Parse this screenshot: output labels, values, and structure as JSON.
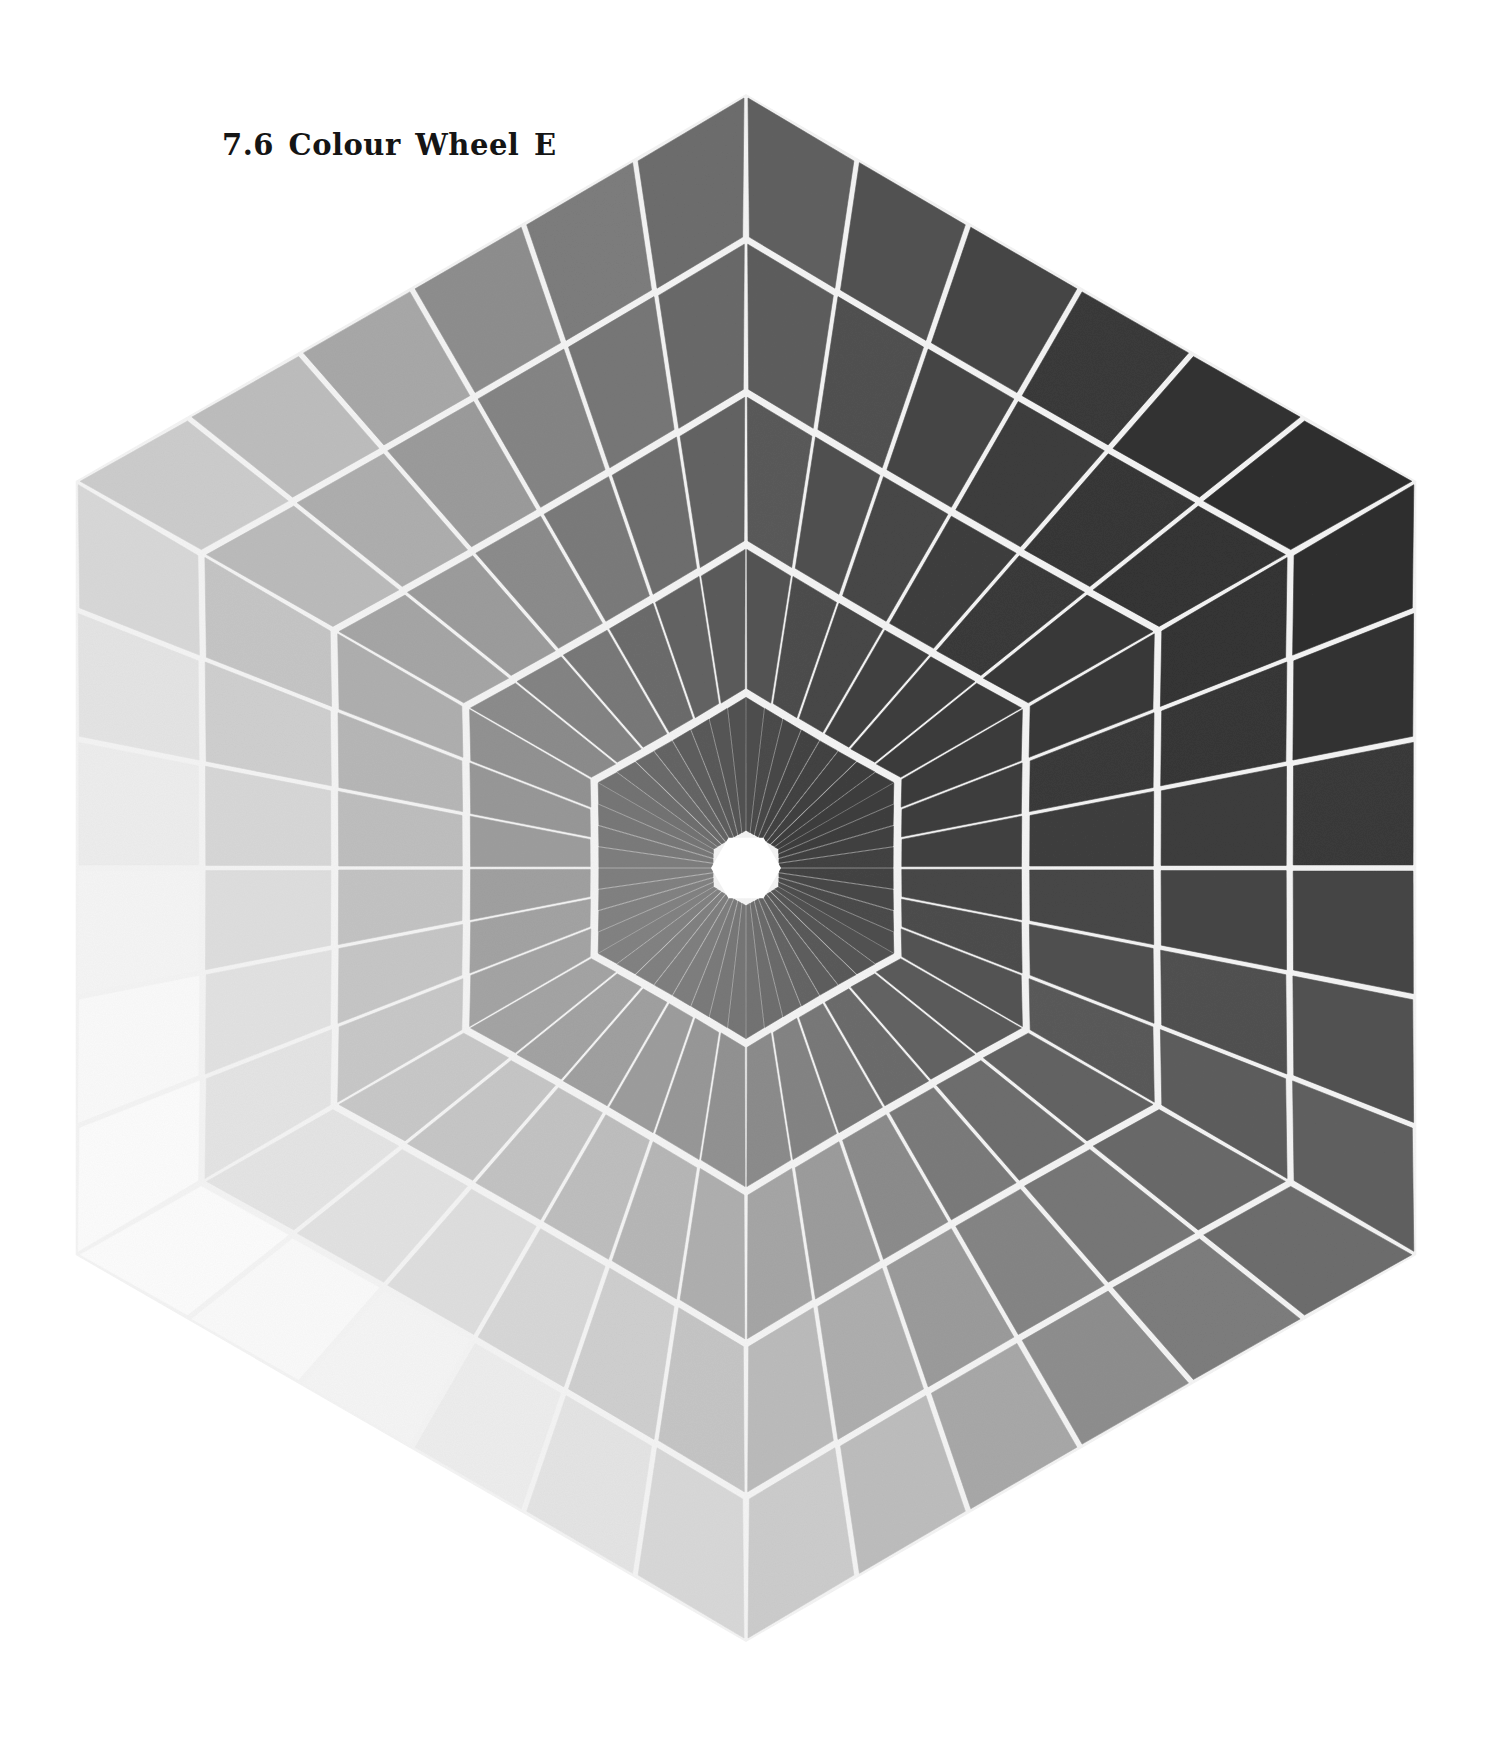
{
  "figure": {
    "title": "7.6 Colour Wheel E"
  },
  "chart_data": {
    "type": "diagram",
    "title": "7.6 Colour Wheel E",
    "geometry": {
      "center": [
        746,
        868
      ],
      "orientation": "pointy-top",
      "ring_radii": [
        774,
        628,
        475,
        323,
        175
      ],
      "hole_radius": 33,
      "spokes_per_face_outer": 6,
      "spokes_per_face_inner": 8,
      "gap_width": 4.5
    },
    "vertices": {
      "top": [
        746,
        94
      ],
      "upper_right": [
        1416,
        481
      ],
      "lower_right": [
        1416,
        1255
      ],
      "bottom": [
        746,
        1642
      ],
      "lower_left": [
        76,
        1255
      ],
      "upper_left": [
        76,
        481
      ]
    },
    "shading": {
      "darkest_direction_deg": -30,
      "lightest_direction_deg": 150,
      "rings": [
        {
          "ring": 1,
          "mid": 150,
          "amp": 102
        },
        {
          "ring": 2,
          "mid": 140,
          "amp": 88
        },
        {
          "ring": 3,
          "mid": 128,
          "amp": 72
        },
        {
          "ring": 4,
          "mid": 112,
          "amp": 52
        },
        {
          "ring": 5,
          "mid": 96,
          "amp": 34
        },
        {
          "ring": 6,
          "mid": 86,
          "amp": 18
        }
      ],
      "gap_color": "#f4f4f4",
      "hole_color": "#ffffff"
    }
  }
}
